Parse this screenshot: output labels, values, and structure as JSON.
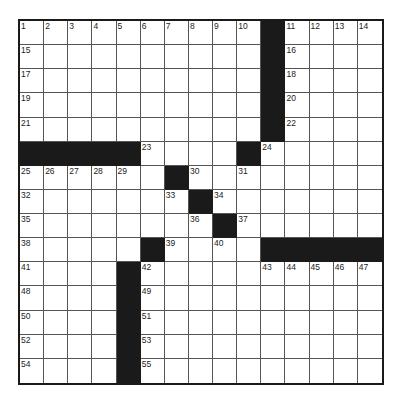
{
  "puzzle": {
    "rows": 15,
    "cols": 15,
    "colors": {
      "black": "#1a1a1a",
      "white": "#ffffff",
      "line": "#555555"
    },
    "layout": [
      "..........#....",
      "..........#....",
      "..........#....",
      "..........#....",
      "..........#....",
      "#####....#.....",
      "......#........",
      ".......#.......",
      "........#......",
      ".....#....#####",
      "....#..........",
      "....#..........",
      "....#..........",
      "....#..........",
      "....#.........."
    ],
    "numbers": [
      {
        "r": 0,
        "c": 0,
        "n": "1"
      },
      {
        "r": 0,
        "c": 1,
        "n": "2"
      },
      {
        "r": 0,
        "c": 2,
        "n": "3"
      },
      {
        "r": 0,
        "c": 3,
        "n": "4"
      },
      {
        "r": 0,
        "c": 4,
        "n": "5"
      },
      {
        "r": 0,
        "c": 5,
        "n": "6"
      },
      {
        "r": 0,
        "c": 6,
        "n": "7"
      },
      {
        "r": 0,
        "c": 7,
        "n": "8"
      },
      {
        "r": 0,
        "c": 8,
        "n": "9"
      },
      {
        "r": 0,
        "c": 9,
        "n": "10"
      },
      {
        "r": 0,
        "c": 11,
        "n": "11"
      },
      {
        "r": 0,
        "c": 12,
        "n": "12"
      },
      {
        "r": 0,
        "c": 13,
        "n": "13"
      },
      {
        "r": 0,
        "c": 14,
        "n": "14"
      },
      {
        "r": 1,
        "c": 0,
        "n": "15"
      },
      {
        "r": 1,
        "c": 11,
        "n": "16"
      },
      {
        "r": 2,
        "c": 0,
        "n": "17"
      },
      {
        "r": 2,
        "c": 11,
        "n": "18"
      },
      {
        "r": 3,
        "c": 0,
        "n": "19"
      },
      {
        "r": 3,
        "c": 11,
        "n": "20"
      },
      {
        "r": 4,
        "c": 0,
        "n": "21"
      },
      {
        "r": 4,
        "c": 11,
        "n": "22"
      },
      {
        "r": 5,
        "c": 5,
        "n": "23"
      },
      {
        "r": 5,
        "c": 10,
        "n": "24"
      },
      {
        "r": 6,
        "c": 0,
        "n": "25"
      },
      {
        "r": 6,
        "c": 1,
        "n": "26"
      },
      {
        "r": 6,
        "c": 2,
        "n": "27"
      },
      {
        "r": 6,
        "c": 3,
        "n": "28"
      },
      {
        "r": 6,
        "c": 4,
        "n": "29"
      },
      {
        "r": 6,
        "c": 7,
        "n": "30"
      },
      {
        "r": 6,
        "c": 9,
        "n": "31"
      },
      {
        "r": 7,
        "c": 0,
        "n": "32"
      },
      {
        "r": 7,
        "c": 6,
        "n": "33"
      },
      {
        "r": 7,
        "c": 8,
        "n": "34"
      },
      {
        "r": 8,
        "c": 0,
        "n": "35"
      },
      {
        "r": 8,
        "c": 7,
        "n": "36"
      },
      {
        "r": 8,
        "c": 9,
        "n": "37"
      },
      {
        "r": 9,
        "c": 0,
        "n": "38"
      },
      {
        "r": 9,
        "c": 6,
        "n": "39"
      },
      {
        "r": 9,
        "c": 8,
        "n": "40"
      },
      {
        "r": 10,
        "c": 0,
        "n": "41"
      },
      {
        "r": 10,
        "c": 5,
        "n": "42"
      },
      {
        "r": 10,
        "c": 10,
        "n": "43"
      },
      {
        "r": 10,
        "c": 11,
        "n": "44"
      },
      {
        "r": 10,
        "c": 12,
        "n": "45"
      },
      {
        "r": 10,
        "c": 13,
        "n": "46"
      },
      {
        "r": 10,
        "c": 14,
        "n": "47"
      },
      {
        "r": 11,
        "c": 0,
        "n": "48"
      },
      {
        "r": 11,
        "c": 5,
        "n": "49"
      },
      {
        "r": 12,
        "c": 0,
        "n": "50"
      },
      {
        "r": 12,
        "c": 5,
        "n": "51"
      },
      {
        "r": 13,
        "c": 0,
        "n": "52"
      },
      {
        "r": 13,
        "c": 5,
        "n": "53"
      },
      {
        "r": 14,
        "c": 0,
        "n": "54"
      },
      {
        "r": 14,
        "c": 5,
        "n": "55"
      }
    ]
  }
}
